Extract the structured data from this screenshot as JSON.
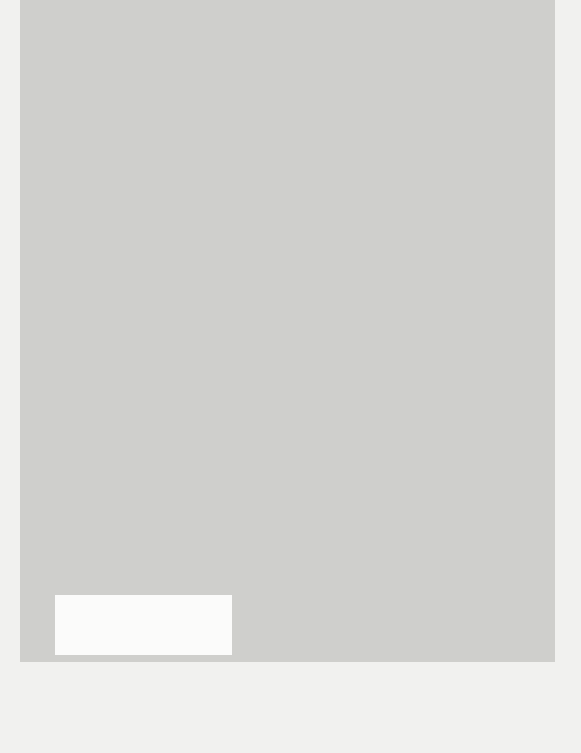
{
  "diagram": {
    "type": "conceptual-model",
    "orientation": "rotated-90-ccw",
    "innovation_box": {
      "title": "THE INNOVATION",
      "items": [
        "Relative advantage",
        "Compatibility",
        "Low complexity",
        "Trialability",
        "Observability",
        "Potential for reinvention",
        "Fuzzy boundaries",
        "Risk",
        "Task issues",
        "Nature of knowledge",
        "required (tacit/explicit)",
        "Technical support"
      ]
    },
    "communication_box": {
      "title1": "COMMUNICATION",
      "title2": "AND INFLUENCE",
      "diffusion_title": "DIFFUSION",
      "diffusion_sub": "(informal, unplanned)",
      "items": [
        "Social networks",
        "Homophily",
        "Peer opinion",
        "Marketing",
        "Expert opinion",
        "Champions",
        "Boundary spanners",
        "Change agents"
      ],
      "dissemination_title": "DISSEMINATION",
      "dissemination_sub": "(formal, planned)"
    },
    "outer_context_box": {
      "title": "OUTER CONTEXT",
      "items": [
        "Sociopolitical climate",
        "Incentives and mandates",
        "Interorganizational",
        "norm-setting and",
        "networks",
        "Environmental stability"
      ]
    },
    "antecedents_box": {
      "title": "SYSTEM ANTECEDENTS FOR INNOVATION",
      "structure_title": "Structure",
      "structure_items": [
        "Size/maturity",
        "Formalization",
        "Differentiation",
        "Decentralization",
        "Slack resources"
      ],
      "absorptive_title": "Absorptive capacity for new knowledge",
      "absorptive_items": [
        "Preexisting knowledge/skills base",
        "Ability to find, interpret, recodify,",
        "and integrate new knowledge",
        "Enablement of knowledge sharing",
        "via internal and external networks"
      ],
      "receptive_title": "Receptive context for change",
      "receptive_items": [
        "Leadership and vision",
        "Good managerial relations",
        "Risk-taking climate",
        "Clear goals and priorities",
        "High-quality data capture"
      ]
    },
    "linkage_box": {
      "title": "LINKAGE",
      "design_title": "Design stage",
      "design_items": [
        "Shared meanings and mission",
        "Effective knowledge transfer",
        "User involvement in specification",
        "Capture of user-led innovation"
      ],
      "impl_title": "Implementation stage",
      "impl_items": [
        "Communication and information",
        "User orientation",
        "Product augmentation, e.g. technical help",
        "Project management support"
      ]
    },
    "readiness_box": {
      "title1": "SYSTEM READINESS",
      "title2": "FOR INNOVATION",
      "items": [
        "Tension for change",
        "Innovation-system fit",
        "Power balances",
        "(supporters v. opponents)",
        "Assessment of implications",
        "Dedicated time/resources",
        "Monitoring and feedback"
      ]
    },
    "adopter_box": {
      "title": "ADOPTER",
      "items": [
        "Needs",
        "Motivation",
        "Values and goals",
        "Skills",
        "Learning style",
        "Social networks"
      ]
    },
    "assimilation_box": {
      "title": "ASSIMILATION",
      "items": [
        "Complex, nonlinear",
        "process",
        "\"Soft periphery\" elements"
      ]
    },
    "implementation_box": {
      "title1": "IMPLEMENTATION",
      "title2": "PROCESS",
      "items": [
        "Decision making devolved",
        "to frontline teams",
        "Hands-on approach by",
        "leaders and managers",
        "Human resource issues,",
        "especially training",
        "Dedicated resources",
        "Internal communication",
        "External collaboration",
        "Reinvention/development",
        "Feedback on progress"
      ]
    },
    "center": {
      "user_system_label": "User system",
      "resource_system_label": "Resource system",
      "knowledge_purveyors_label1": "Knowledge",
      "knowledge_purveyors_label2": "purveyors",
      "change_agency_label": "Change agency",
      "outer_context_label": "Outer context",
      "nodes": {
        "system_antecedents": "System antecedents",
        "system_readiness": "System readiness",
        "adoption": "Adoption/assimilation",
        "implementation": "Implementation",
        "consequences": "Consequences",
        "innovation": "The innovation",
        "diffusion": "Diffusion",
        "dissemination": "Dissemination"
      },
      "linkage_arrow_1": "LINKAGE",
      "linkage_arrow_2": "LINKAGE"
    },
    "colors": {
      "background_gray": "#cfcfcc",
      "box_white": "#fbfbfa",
      "ink": "#1e1e1e"
    }
  }
}
